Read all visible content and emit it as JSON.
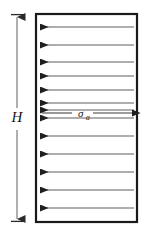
{
  "figure": {
    "background_color": "#ffffff",
    "ink_color": "#1b1b1b",
    "line_color": "#555555"
  },
  "block": {
    "name": "rectangular-block",
    "x": 36,
    "y": 14,
    "width": 101,
    "height": 208,
    "border_color": "#1a1a1a",
    "border_width": 2.2,
    "fill": "#ffffff"
  },
  "height_dimension": {
    "label": "H",
    "label_x": 17,
    "label_y": 120,
    "line_x": 17,
    "top_y": 14,
    "bottom_y": 222,
    "tick_half_width": 6,
    "color": "#2a2a2a"
  },
  "stress": {
    "symbol": "σ",
    "subscript": "a",
    "label_x": 82,
    "label_y": 117,
    "arrow_y": 113,
    "arrow_start_x": 40,
    "arrow_end_x": 134,
    "direction": "right"
  },
  "stress_arrows": {
    "direction": "left",
    "count": 13,
    "start_x": 134,
    "tip_x": 39,
    "color": "#5a5a5a",
    "head_color": "#1f1f1f",
    "line_width": 1.1,
    "y_positions": [
      27,
      45,
      62,
      76,
      90,
      103,
      110,
      118,
      136,
      154,
      172,
      190,
      208
    ]
  }
}
